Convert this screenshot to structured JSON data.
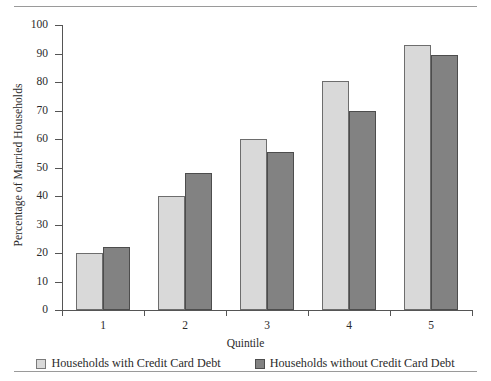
{
  "figure": {
    "top_rule": "horizontal-rule",
    "bottom_rule": "horizontal-rule"
  },
  "chart_data": {
    "type": "bar",
    "title": "",
    "xlabel": "Quintile",
    "ylabel": "Percentage of Married Households",
    "categories": [
      "1",
      "2",
      "3",
      "4",
      "5"
    ],
    "series": [
      {
        "name": "Households with Credit Card Debt",
        "color": "#d9d9d9",
        "values": [
          20,
          40,
          60,
          80.5,
          93
        ]
      },
      {
        "name": "Households without Credit Card Debt",
        "color": "#828282",
        "values": [
          22,
          48,
          55.5,
          70,
          89.5
        ]
      }
    ],
    "ylim": [
      0,
      100
    ],
    "yticks": [
      0,
      10,
      20,
      30,
      40,
      50,
      60,
      70,
      80,
      90,
      100
    ],
    "ytick_labels": [
      "0",
      "10",
      "20",
      "30",
      "40",
      "50",
      "60",
      "70",
      "80",
      "90",
      "100"
    ],
    "xtick_labels": [
      "1",
      "2",
      "3",
      "4",
      "5"
    ],
    "grid": false,
    "legend_position": "bottom"
  },
  "legend": {
    "items": [
      {
        "label": "Households with Credit Card Debt",
        "swatch": "light-gray-swatch"
      },
      {
        "label": "Households without Credit Card Debt",
        "swatch": "dark-gray-swatch"
      }
    ]
  }
}
